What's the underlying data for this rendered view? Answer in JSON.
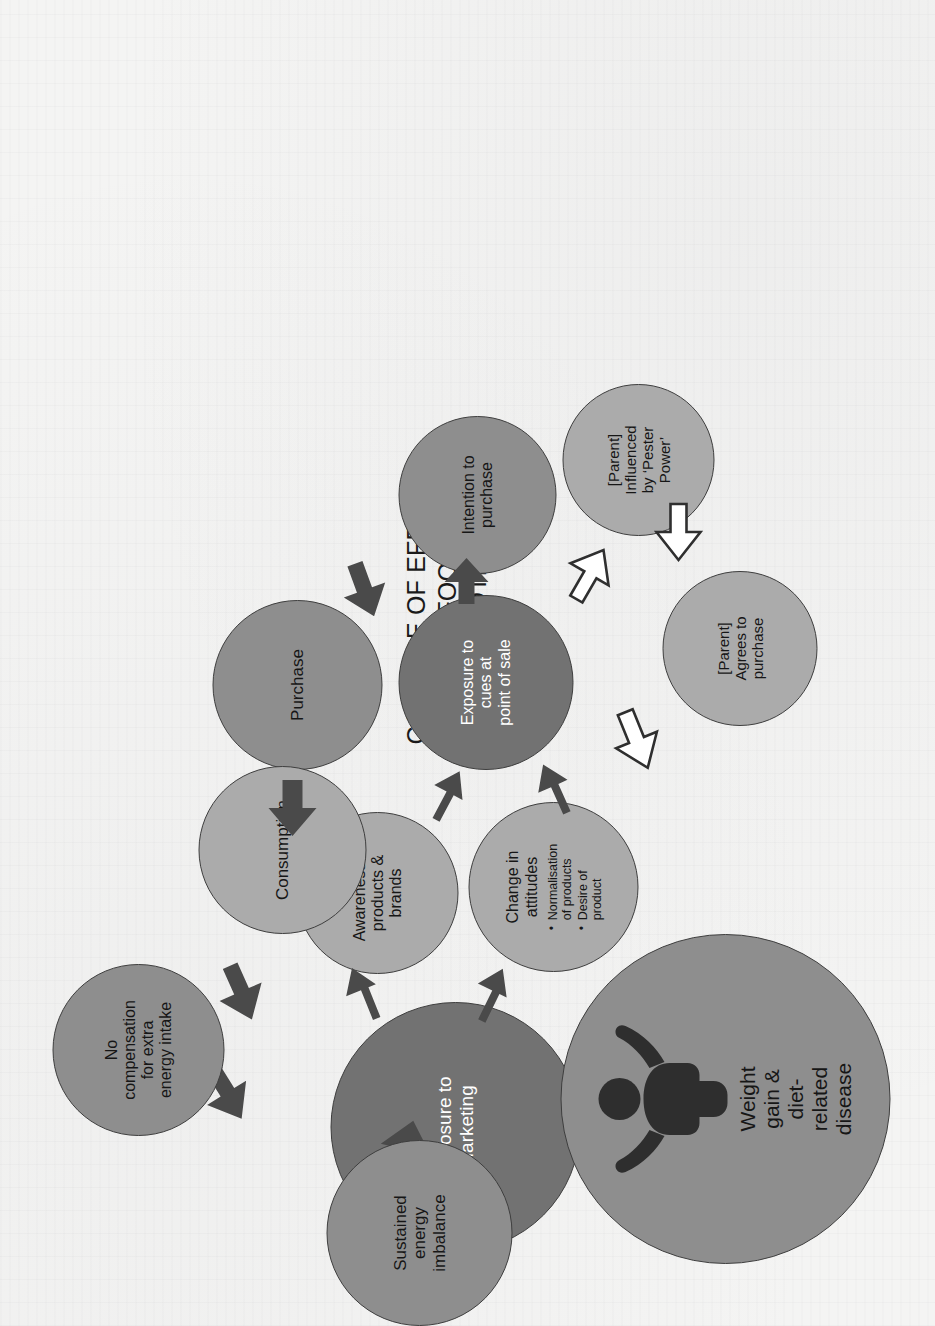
{
  "figure": {
    "title": "CASCADE OF EFFECTS\nTO FOOD\nPROMOTIONS",
    "colors": {
      "node_light": "#ababab",
      "node_mid": "#8e8e8e",
      "node_dark": "#727272",
      "arrow_filled": "#4a4a4a",
      "arrow_outline_stroke": "#2f2f2f",
      "node_outline": "#3e3e3e",
      "text_dark": "#161616",
      "text_light": "#ffffff",
      "page_background": "#f4f4f3"
    },
    "nodes": [
      {
        "id": "exposure-to-marketing",
        "label": "Exposure to\nMarketing",
        "shade": "dark",
        "text_color": "white"
      },
      {
        "id": "awareness-of-products-brands",
        "label": "Awareness of\nproducts &\nbrands",
        "shade": "light",
        "text_color": "dark"
      },
      {
        "id": "change-in-attitudes",
        "label": "Change in\nattitudes",
        "shade": "light",
        "text_color": "dark",
        "bullets": [
          "Normalisation\nof products",
          "Desire of\nproduct"
        ]
      },
      {
        "id": "exposure-to-cues-at-point-of-sale",
        "label": "Exposure to\ncues at\npoint of sale",
        "shade": "dark",
        "text_color": "white"
      },
      {
        "id": "parent-influenced-by-pester-power",
        "label": "[Parent]\nInfluenced\nby ‘Pester\nPower’",
        "shade": "light",
        "text_color": "dark"
      },
      {
        "id": "parent-agrees-to-purchase",
        "label": "[Parent]\nAgrees to\npurchase",
        "shade": "light",
        "text_color": "dark"
      },
      {
        "id": "intention-to-purchase",
        "label": "Intention to\npurchase",
        "shade": "mid",
        "text_color": "dark"
      },
      {
        "id": "purchase",
        "label": "Purchase",
        "shade": "mid",
        "text_color": "dark"
      },
      {
        "id": "consumption",
        "label": "Consumption",
        "shade": "light",
        "text_color": "dark"
      },
      {
        "id": "no-compensation-for-extra-energy-intake",
        "label": "No\ncompensation\nfor extra\nenergy intake",
        "shade": "mid",
        "text_color": "dark"
      },
      {
        "id": "sustained-energy-imbalance",
        "label": "Sustained\nenergy\nimbalance",
        "shade": "mid",
        "text_color": "dark"
      },
      {
        "id": "weight-gain-diet-related-disease",
        "label": "Weight\ngain &\ndiet-\nrelated\ndisease",
        "shade": "mid",
        "text_color": "dark",
        "icon": "person-icon"
      }
    ],
    "arrows": [
      {
        "id": "exposure-to-awareness",
        "style": "filled"
      },
      {
        "id": "exposure-to-change-in-attitudes",
        "style": "filled"
      },
      {
        "id": "awareness-to-point-of-sale",
        "style": "filled"
      },
      {
        "id": "change-in-attitudes-to-point-of-sale",
        "style": "filled"
      },
      {
        "id": "point-of-sale-to-pester-power",
        "style": "outline"
      },
      {
        "id": "pester-power-to-parent-agrees",
        "style": "outline"
      },
      {
        "id": "parent-agrees-to-purchase",
        "style": "outline"
      },
      {
        "id": "point-of-sale-to-intention",
        "style": "filled"
      },
      {
        "id": "intention-to-purchase",
        "style": "filled"
      },
      {
        "id": "purchase-to-consumption",
        "style": "filled"
      },
      {
        "id": "consumption-to-no-compensation",
        "style": "filled"
      },
      {
        "id": "no-compensation-to-sustained-imbalance",
        "style": "filled"
      },
      {
        "id": "sustained-imbalance-to-weight-gain",
        "style": "filled"
      }
    ]
  }
}
